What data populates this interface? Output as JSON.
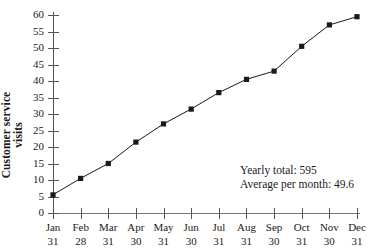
{
  "chart_data": {
    "type": "line",
    "title": "",
    "xlabel": "",
    "ylabel": "Customer service visits",
    "ylabel_lines": [
      "Customer service",
      "visits"
    ],
    "categories": [
      "Jan 31",
      "Feb 28",
      "Mar 31",
      "Apr 30",
      "May 31",
      "Jun 30",
      "Jul 31",
      "Aug 31",
      "Sep 30",
      "Oct 31",
      "Nov 30",
      "Dec 31"
    ],
    "x_tick_months": [
      "Jan",
      "Feb",
      "Mar",
      "Apr",
      "May",
      "Jun",
      "Jul",
      "Aug",
      "Sep",
      "Oct",
      "Nov",
      "Dec"
    ],
    "x_tick_days": [
      "31",
      "28",
      "31",
      "30",
      "31",
      "30",
      "31",
      "31",
      "30",
      "31",
      "30",
      "31"
    ],
    "values": [
      5.5,
      10.5,
      15,
      21.5,
      27,
      31.5,
      36.5,
      40.5,
      43,
      50.5,
      57,
      59.5
    ],
    "ylim": [
      0,
      60
    ],
    "y_ticks": [
      0,
      5,
      10,
      15,
      20,
      25,
      30,
      35,
      40,
      45,
      50,
      55,
      60
    ],
    "y_tick_labels": [
      "0",
      "5",
      "10",
      "15",
      "20",
      "25",
      "30",
      "35",
      "40",
      "45",
      "50",
      "55",
      "60"
    ],
    "grid": false,
    "legend": "none",
    "marker": "square",
    "series_color": "#1a1a1a",
    "annotations": [
      "Yearly total: 595",
      "Average per month: 49.6"
    ]
  },
  "annotation": {
    "line1": "Yearly total: 595",
    "line2": "Average per month: 49.6"
  },
  "axis": {
    "y_title_line1": "Customer service",
    "y_title_line2": "visits"
  }
}
